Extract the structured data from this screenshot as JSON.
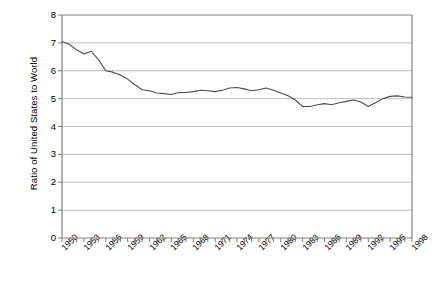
{
  "chart_data": {
    "type": "line",
    "title": "",
    "xlabel": "",
    "ylabel": "Ratio of United States to World",
    "ylim": [
      0,
      8
    ],
    "xlim": [
      1950,
      1998
    ],
    "grid": true,
    "legend": "none",
    "ytick_labels": [
      "8",
      "7",
      "6",
      "5",
      "4",
      "3",
      "2",
      "1",
      "0"
    ],
    "ytick_values": [
      8,
      7,
      6,
      5,
      4,
      3,
      2,
      1,
      0
    ],
    "xtick_labels": [
      "1950",
      "1953",
      "1956",
      "1959",
      "1962",
      "1965",
      "1968",
      "1971",
      "1974",
      "1977",
      "1980",
      "1983",
      "1986",
      "1989",
      "1992",
      "1995",
      "1998"
    ],
    "xtick_values": [
      1950,
      1953,
      1956,
      1959,
      1962,
      1965,
      1968,
      1971,
      1974,
      1977,
      1980,
      1983,
      1986,
      1989,
      1992,
      1995,
      1998
    ],
    "x": [
      1950,
      1951,
      1952,
      1953,
      1954,
      1955,
      1956,
      1957,
      1958,
      1959,
      1960,
      1961,
      1962,
      1963,
      1964,
      1965,
      1966,
      1967,
      1968,
      1969,
      1970,
      1971,
      1972,
      1973,
      1974,
      1975,
      1976,
      1977,
      1978,
      1979,
      1980,
      1981,
      1982,
      1983,
      1984,
      1985,
      1986,
      1987,
      1988,
      1989,
      1990,
      1991,
      1992,
      1993,
      1994,
      1995,
      1996,
      1997,
      1998
    ],
    "values": [
      7.05,
      6.95,
      6.75,
      6.6,
      6.7,
      6.4,
      6.0,
      5.95,
      5.85,
      5.7,
      5.5,
      5.32,
      5.28,
      5.2,
      5.18,
      5.15,
      5.22,
      5.22,
      5.25,
      5.3,
      5.28,
      5.25,
      5.3,
      5.38,
      5.4,
      5.35,
      5.28,
      5.32,
      5.38,
      5.3,
      5.2,
      5.1,
      4.95,
      4.72,
      4.72,
      4.78,
      4.82,
      4.78,
      4.85,
      4.9,
      4.95,
      4.88,
      4.72,
      4.85,
      5.0,
      5.08,
      5.1,
      5.06,
      5.05
    ],
    "series_name": "Ratio of United States to World",
    "line_color": "#4d4d4d",
    "grid_color": "#bfbfbf",
    "axis_color": "#808080"
  },
  "geometry": {
    "plot_left": 62,
    "plot_right": 412,
    "plot_top": 15,
    "plot_bottom": 238
  }
}
